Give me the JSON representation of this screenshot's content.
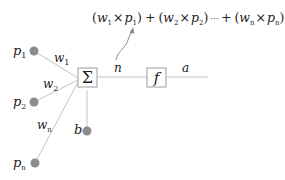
{
  "formula": {
    "open1": "(",
    "w1": "w",
    "w1_sub": "1",
    "times1": "×",
    "p1": "p",
    "p1_sub": "1",
    "close1": ")",
    "plus1": "+",
    "open2": "(",
    "w2": "w",
    "w2_sub": "2",
    "times2": "×",
    "p2": "p",
    "p2_sub": "2",
    "close2": ")",
    "dots": "···",
    "plus2": "+",
    "open3": "(",
    "wn": "w",
    "wn_sub": "n",
    "times3": "×",
    "pn": "p",
    "pn_sub": "n",
    "close3": ")",
    "plus3": "+",
    "b": "b"
  },
  "inputs": [
    {
      "label": "p",
      "sub": "1"
    },
    {
      "label": "p",
      "sub": "2"
    },
    {
      "label": "p",
      "sub": "n"
    }
  ],
  "weights": [
    {
      "label": "w",
      "sub": "1"
    },
    {
      "label": "w",
      "sub": "2"
    },
    {
      "label": "w",
      "sub": "n"
    }
  ],
  "bias": {
    "label": "b"
  },
  "summation": {
    "symbol": "Σ"
  },
  "net_input": {
    "label": "n"
  },
  "transfer": {
    "symbol": "f"
  },
  "output": {
    "label": "a"
  },
  "colors": {
    "line": "#bdbdbd",
    "node": "#8c8c8c",
    "box_border": "#9e9e9e",
    "arrow": "#8a8a8a",
    "text": "#222222"
  }
}
